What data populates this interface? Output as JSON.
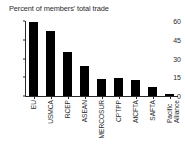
{
  "chart_data": {
    "type": "bar",
    "title": "Percent of members' total trade",
    "subtitle": "",
    "xlabel": "",
    "ylabel": "",
    "categories": [
      "EU",
      "USMCA",
      "RCEP",
      "ASEAN",
      "MERCOSUR",
      "CPTPP",
      "AfCFTA",
      "SAFTA",
      "Pacific\nAlliance"
    ],
    "values": [
      59,
      52,
      35,
      24,
      14,
      14.5,
      13,
      7,
      2
    ],
    "ylim": [
      0,
      60
    ],
    "yticks": [
      0,
      15,
      30,
      45,
      60
    ],
    "ytick_labels": [
      "0",
      "15",
      "30",
      "45",
      "60"
    ],
    "grid": false,
    "legend": null,
    "bar_color": "#000000",
    "axis_color": "#2b2b2b"
  }
}
